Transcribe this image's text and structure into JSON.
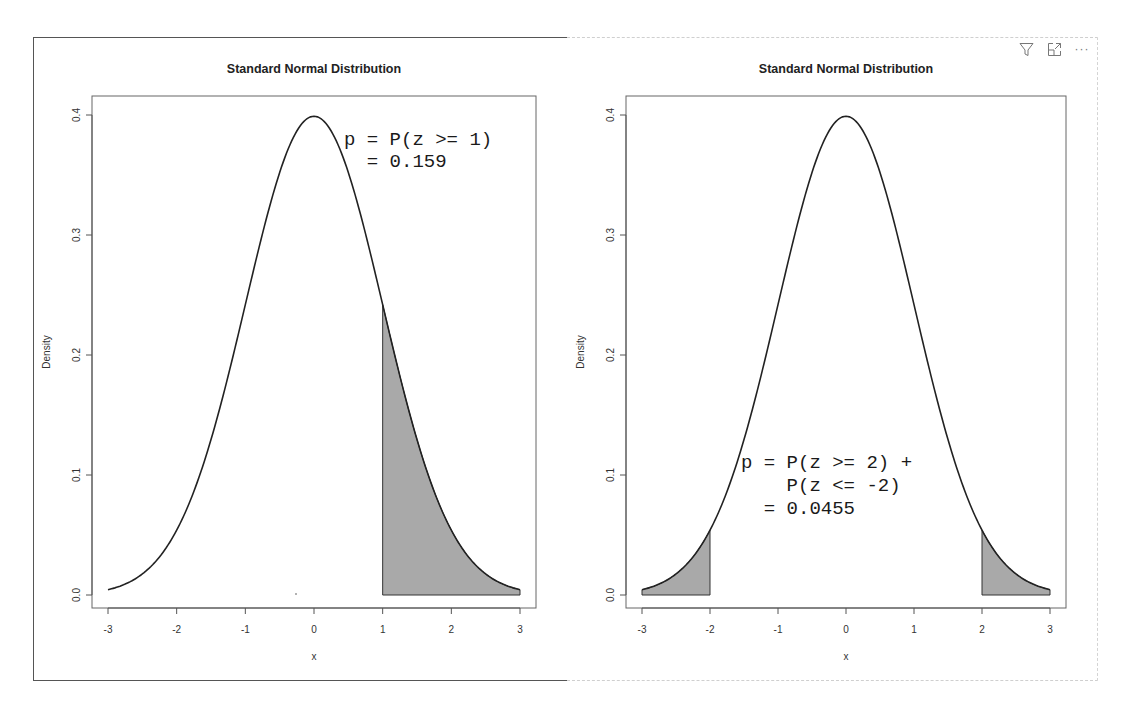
{
  "visual_header": {
    "icons": [
      "filter-icon",
      "focus-mode-icon",
      "more-options-icon"
    ],
    "more_label": "···"
  },
  "chart_data": [
    {
      "type": "area",
      "title": "Standard Normal Distribution",
      "xlabel": "x",
      "ylabel": "Density",
      "xlim": [
        -3,
        3
      ],
      "ylim": [
        0,
        0.4
      ],
      "x_ticks": [
        "-3",
        "-2",
        "-1",
        "0",
        "1",
        "2",
        "3"
      ],
      "y_ticks": [
        "0.0",
        "0.1",
        "0.2",
        "0.3",
        "0.4"
      ],
      "grid": false,
      "legend": null,
      "curve": "standard normal pdf, dnorm(x)",
      "x": [
        -3,
        -2.5,
        -2,
        -1.5,
        -1,
        -0.5,
        0,
        0.5,
        1,
        1.5,
        2,
        2.5,
        3
      ],
      "values": [
        0.0044,
        0.0175,
        0.054,
        0.1295,
        0.242,
        0.3521,
        0.3989,
        0.3521,
        0.242,
        0.1295,
        0.054,
        0.0175,
        0.0044
      ],
      "shaded_regions": [
        [
          1,
          3
        ]
      ],
      "shade_color": "#a9a9a9",
      "annotation": [
        "p = P(z >= 1)",
        "  = 0.159"
      ],
      "p_value": 0.159
    },
    {
      "type": "area",
      "title": "Standard Normal Distribution",
      "xlabel": "x",
      "ylabel": "Density",
      "xlim": [
        -3,
        3
      ],
      "ylim": [
        0,
        0.4
      ],
      "x_ticks": [
        "-3",
        "-2",
        "-1",
        "0",
        "1",
        "2",
        "3"
      ],
      "y_ticks": [
        "0.0",
        "0.1",
        "0.2",
        "0.3",
        "0.4"
      ],
      "grid": false,
      "legend": null,
      "curve": "standard normal pdf, dnorm(x)",
      "x": [
        -3,
        -2.5,
        -2,
        -1.5,
        -1,
        -0.5,
        0,
        0.5,
        1,
        1.5,
        2,
        2.5,
        3
      ],
      "values": [
        0.0044,
        0.0175,
        0.054,
        0.1295,
        0.242,
        0.3521,
        0.3989,
        0.3521,
        0.242,
        0.1295,
        0.054,
        0.0175,
        0.0044
      ],
      "shaded_regions": [
        [
          -3,
          -2
        ],
        [
          2,
          3
        ]
      ],
      "shade_color": "#a9a9a9",
      "annotation": [
        "p = P(z >= 2) +",
        "    P(z <= -2)",
        "  = 0.0455"
      ],
      "p_value": 0.0455
    }
  ]
}
